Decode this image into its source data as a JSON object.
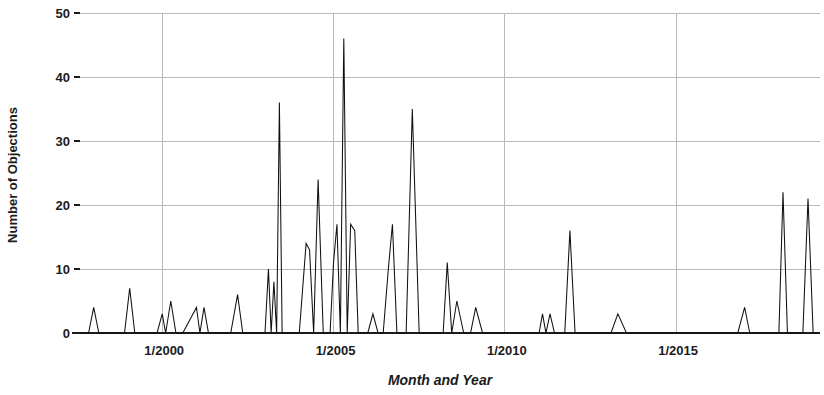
{
  "chart_data": {
    "type": "line",
    "title": "",
    "xlabel": "Month and Year",
    "ylabel": "Number of Objections",
    "xlim": [
      1997.6,
      2019.2
    ],
    "ylim": [
      0,
      50
    ],
    "grid": true,
    "legend": false,
    "legend_position": "none",
    "y_ticks": [
      0,
      10,
      20,
      30,
      40,
      50
    ],
    "y_tick_labels": [
      "0",
      "10",
      "20",
      "30",
      "40",
      "50"
    ],
    "x_ticks": [
      2000,
      2005,
      2010,
      2015
    ],
    "x_tick_labels": [
      "1/2000",
      "1/2005",
      "1/2010",
      "1/2015"
    ],
    "series": [
      {
        "name": "Objections",
        "x": [
          1997.6,
          1997.85,
          1998.0,
          1998.15,
          1998.4,
          1998.9,
          1999.05,
          1999.2,
          1999.4,
          1999.85,
          2000.0,
          2000.1,
          2000.25,
          2000.4,
          2000.6,
          2001.0,
          2001.1,
          2001.22,
          2001.35,
          2001.5,
          2002.0,
          2002.2,
          2002.35,
          2002.55,
          2003.0,
          2003.1,
          2003.18,
          2003.26,
          2003.34,
          2003.42,
          2003.5,
          2003.58,
          2003.66,
          2003.8,
          2004.0,
          2004.2,
          2004.3,
          2004.42,
          2004.55,
          2004.7,
          2004.9,
          2005.0,
          2005.1,
          2005.2,
          2005.3,
          2005.4,
          2005.5,
          2005.62,
          2005.72,
          2005.85,
          2006.0,
          2006.15,
          2006.3,
          2006.45,
          2006.6,
          2006.72,
          2006.85,
          2007.0,
          2007.12,
          2007.3,
          2007.5,
          2008.0,
          2008.2,
          2008.32,
          2008.45,
          2008.6,
          2008.8,
          2009.0,
          2009.15,
          2009.35,
          2009.6,
          2010.0,
          2010.5,
          2011.0,
          2011.1,
          2011.2,
          2011.32,
          2011.45,
          2011.6,
          2011.75,
          2011.9,
          2012.05,
          2012.2,
          2012.45,
          2012.8,
          2013.1,
          2013.3,
          2013.55,
          2014.0,
          2015.0,
          2016.0,
          2016.8,
          2017.0,
          2017.15,
          2017.35,
          2017.7,
          2018.0,
          2018.12,
          2018.25,
          2018.45,
          2018.7,
          2018.85,
          2019.0,
          2019.1,
          2019.2
        ],
        "values": [
          0,
          0,
          4,
          0,
          0,
          0,
          7,
          0,
          0,
          0,
          3,
          0,
          5,
          0,
          0,
          4,
          0,
          4,
          0,
          0,
          0,
          6,
          0,
          0,
          0,
          10,
          0,
          8,
          0,
          36,
          0,
          0,
          0,
          0,
          0,
          14,
          13,
          0,
          24,
          0,
          0,
          11,
          17,
          0,
          46,
          0,
          17,
          16,
          0,
          0,
          0,
          3,
          0,
          0,
          10,
          17,
          0,
          0,
          0,
          35,
          0,
          0,
          0,
          11,
          0,
          5,
          0,
          0,
          4,
          0,
          0,
          0,
          0,
          0,
          3,
          0,
          3,
          0,
          0,
          0,
          16,
          0,
          0,
          0,
          0,
          0,
          3,
          0,
          0,
          0,
          0,
          0,
          4,
          0,
          0,
          0,
          0,
          22,
          0,
          0,
          0,
          21,
          0,
          0,
          0
        ]
      }
    ],
    "peaks": [
      {
        "x": "1998",
        "y": 4
      },
      {
        "x": "1999",
        "y": 7
      },
      {
        "x": "2000 early",
        "y": 3
      },
      {
        "x": "2000 mid",
        "y": 5
      },
      {
        "x": "2001a",
        "y": 4
      },
      {
        "x": "2001b",
        "y": 4
      },
      {
        "x": "2002",
        "y": 6
      },
      {
        "x": "2003a",
        "y": 10
      },
      {
        "x": "2003b",
        "y": 8
      },
      {
        "x": "2003c",
        "y": 36
      },
      {
        "x": "2004a",
        "y": 14
      },
      {
        "x": "2004b",
        "y": 13
      },
      {
        "x": "2004c",
        "y": 24
      },
      {
        "x": "2005a",
        "y": 11
      },
      {
        "x": "2005b",
        "y": 17
      },
      {
        "x": "2005c",
        "y": 46
      },
      {
        "x": "2005d",
        "y": 17
      },
      {
        "x": "2005e",
        "y": 16
      },
      {
        "x": "2006a",
        "y": 3
      },
      {
        "x": "2006b",
        "y": 10
      },
      {
        "x": "2006c",
        "y": 17
      },
      {
        "x": "2007",
        "y": 35
      },
      {
        "x": "2008a",
        "y": 11
      },
      {
        "x": "2008b",
        "y": 5
      },
      {
        "x": "2009",
        "y": 4
      },
      {
        "x": "2011a",
        "y": 3
      },
      {
        "x": "2011b",
        "y": 3
      },
      {
        "x": "2011c",
        "y": 16
      },
      {
        "x": "2013",
        "y": 3
      },
      {
        "x": "2017",
        "y": 4
      },
      {
        "x": "2018a",
        "y": 22
      },
      {
        "x": "2018b",
        "y": 21
      }
    ]
  },
  "axes": {
    "y_title": "Number of Objections",
    "x_title": "Month and Year",
    "y_labels": [
      "50",
      "40",
      "30",
      "20",
      "10",
      "0"
    ],
    "x_labels": [
      "1/2000",
      "1/2005",
      "1/2010",
      "1/2015"
    ]
  },
  "colors": {
    "series": "#111111",
    "grid": "#b9b9b9",
    "axis": "#1b1b1b",
    "background": "#ffffff"
  }
}
